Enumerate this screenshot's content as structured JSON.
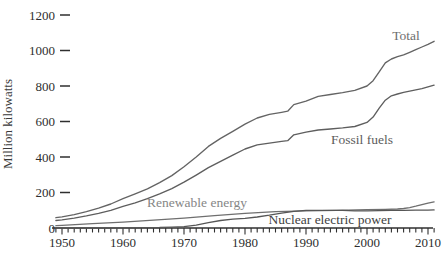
{
  "chart_data": {
    "type": "line",
    "title": "",
    "ylabel": "Million kilowatts",
    "xlabel": "",
    "x_range": [
      1949,
      2011
    ],
    "y_range": [
      0,
      1200
    ],
    "y_ticks": [
      0,
      200,
      400,
      600,
      800,
      1000,
      1200
    ],
    "x_ticks": [
      1950,
      1960,
      1970,
      1980,
      1990,
      2000,
      2010
    ],
    "minor_x_tick_interval_years": 1,
    "grid": "off",
    "legend": "inline-labels",
    "axis_color": "#2f2f2f",
    "series": [
      {
        "name": "Total",
        "color": "#646464",
        "label_color": "#6e6e6e",
        "points": [
          [
            1949,
            58
          ],
          [
            1950,
            63
          ],
          [
            1952,
            75
          ],
          [
            1954,
            92
          ],
          [
            1956,
            112
          ],
          [
            1958,
            135
          ],
          [
            1960,
            165
          ],
          [
            1962,
            192
          ],
          [
            1964,
            220
          ],
          [
            1966,
            255
          ],
          [
            1968,
            295
          ],
          [
            1970,
            345
          ],
          [
            1972,
            400
          ],
          [
            1974,
            460
          ],
          [
            1976,
            505
          ],
          [
            1978,
            545
          ],
          [
            1980,
            585
          ],
          [
            1982,
            620
          ],
          [
            1984,
            640
          ],
          [
            1986,
            652
          ],
          [
            1987,
            658
          ],
          [
            1988,
            695
          ],
          [
            1990,
            715
          ],
          [
            1992,
            742
          ],
          [
            1994,
            752
          ],
          [
            1996,
            762
          ],
          [
            1998,
            775
          ],
          [
            2000,
            800
          ],
          [
            2001,
            830
          ],
          [
            2002,
            880
          ],
          [
            2003,
            930
          ],
          [
            2004,
            952
          ],
          [
            2005,
            965
          ],
          [
            2006,
            975
          ],
          [
            2007,
            990
          ],
          [
            2008,
            1005
          ],
          [
            2009,
            1020
          ],
          [
            2010,
            1035
          ],
          [
            2011,
            1052
          ]
        ]
      },
      {
        "name": "Fossil fuels",
        "color": "#5e5e5e",
        "label_color": "#5c5c5c",
        "points": [
          [
            1949,
            42
          ],
          [
            1950,
            46
          ],
          [
            1952,
            56
          ],
          [
            1954,
            68
          ],
          [
            1956,
            82
          ],
          [
            1958,
            100
          ],
          [
            1960,
            122
          ],
          [
            1962,
            142
          ],
          [
            1964,
            165
          ],
          [
            1966,
            192
          ],
          [
            1968,
            222
          ],
          [
            1970,
            258
          ],
          [
            1972,
            298
          ],
          [
            1974,
            340
          ],
          [
            1976,
            375
          ],
          [
            1978,
            410
          ],
          [
            1980,
            445
          ],
          [
            1982,
            468
          ],
          [
            1984,
            478
          ],
          [
            1986,
            488
          ],
          [
            1987,
            492
          ],
          [
            1988,
            525
          ],
          [
            1990,
            540
          ],
          [
            1992,
            552
          ],
          [
            1994,
            558
          ],
          [
            1996,
            564
          ],
          [
            1998,
            572
          ],
          [
            2000,
            595
          ],
          [
            2001,
            625
          ],
          [
            2002,
            675
          ],
          [
            2003,
            720
          ],
          [
            2004,
            745
          ],
          [
            2005,
            755
          ],
          [
            2006,
            764
          ],
          [
            2007,
            771
          ],
          [
            2008,
            778
          ],
          [
            2009,
            785
          ],
          [
            2010,
            795
          ],
          [
            2011,
            805
          ]
        ]
      },
      {
        "name": "Renewable energy",
        "color": "#6f6f6f",
        "label_color": "#868686",
        "points": [
          [
            1949,
            13
          ],
          [
            1950,
            15
          ],
          [
            1955,
            24
          ],
          [
            1960,
            33
          ],
          [
            1965,
            44
          ],
          [
            1970,
            56
          ],
          [
            1975,
            70
          ],
          [
            1980,
            83
          ],
          [
            1985,
            92
          ],
          [
            1990,
            97
          ],
          [
            1995,
            100
          ],
          [
            2000,
            103
          ],
          [
            2003,
            105
          ],
          [
            2005,
            107
          ],
          [
            2006,
            110
          ],
          [
            2007,
            115
          ],
          [
            2008,
            123
          ],
          [
            2009,
            132
          ],
          [
            2010,
            140
          ],
          [
            2011,
            147
          ]
        ]
      },
      {
        "name": "Nuclear electric power",
        "color": "#565656",
        "label_color": "#3f3f3f",
        "points": [
          [
            1949,
            0
          ],
          [
            1956,
            0
          ],
          [
            1958,
            0
          ],
          [
            1960,
            1
          ],
          [
            1962,
            1
          ],
          [
            1964,
            2
          ],
          [
            1966,
            3
          ],
          [
            1968,
            5
          ],
          [
            1970,
            8
          ],
          [
            1972,
            16
          ],
          [
            1974,
            30
          ],
          [
            1976,
            42
          ],
          [
            1978,
            50
          ],
          [
            1980,
            54
          ],
          [
            1982,
            62
          ],
          [
            1984,
            72
          ],
          [
            1986,
            84
          ],
          [
            1988,
            94
          ],
          [
            1990,
            99
          ],
          [
            1992,
            99
          ],
          [
            1994,
            99
          ],
          [
            1996,
            100
          ],
          [
            1998,
            97
          ],
          [
            2000,
            97
          ],
          [
            2002,
            98
          ],
          [
            2004,
            100
          ],
          [
            2006,
            100
          ],
          [
            2008,
            101
          ],
          [
            2010,
            101
          ],
          [
            2011,
            102
          ]
        ]
      }
    ]
  }
}
